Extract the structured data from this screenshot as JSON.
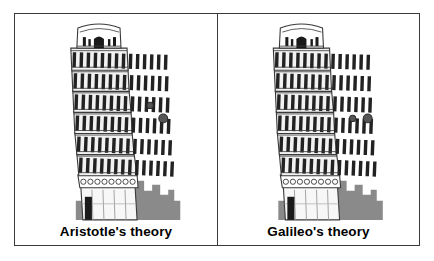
{
  "figure": {
    "border_color": "#3a3a3a",
    "background": "#ffffff"
  },
  "panels": [
    {
      "id": "aristotle",
      "caption": "Aristotle's theory",
      "subject": "leaning-tower-of-pisa",
      "balls": [
        {
          "name": "small-ball",
          "size": "small",
          "diameter_px": 6,
          "x_px": 148,
          "y_px": 104,
          "color": "#4a4a4a"
        },
        {
          "name": "large-ball",
          "size": "large",
          "diameter_px": 9,
          "x_px": 161,
          "y_px": 117,
          "color": "#4a4a4a"
        }
      ],
      "ball_alignment": "staggered",
      "meaning": "heavier ball falls faster and is lower than the lighter ball"
    },
    {
      "id": "galileo",
      "caption": "Galileo's theory",
      "subject": "leaning-tower-of-pisa",
      "balls": [
        {
          "name": "small-ball",
          "size": "small",
          "diameter_px": 6,
          "x_px": 360,
          "y_px": 117,
          "color": "#4a4a4a"
        },
        {
          "name": "large-ball",
          "size": "large",
          "diameter_px": 9,
          "x_px": 375,
          "y_px": 117,
          "color": "#4a4a4a"
        }
      ],
      "ball_alignment": "level",
      "meaning": "both balls fall at the same rate and stay level"
    }
  ],
  "tower": {
    "name": "leaning-tower-of-pisa",
    "tiers": 6,
    "lean_direction": "right",
    "stroke_color": "#3a3a3a",
    "column_color": "#1a1a1a",
    "wall_color": "#f2f2f2"
  },
  "hill": {
    "name": "background-building",
    "color": "#8a8a8a"
  },
  "doorway": {
    "name": "tower-doorway",
    "color": "#1a1a1a"
  }
}
